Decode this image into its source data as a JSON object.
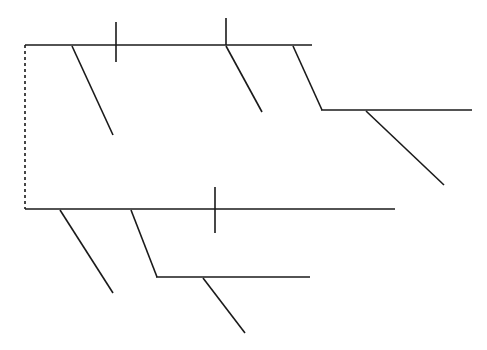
{
  "document": {
    "title": "Branching Line Diagram",
    "background_color": "#ffffff",
    "width": 487,
    "height": 350
  },
  "style": {
    "line_color": "#1a1a1a",
    "line_width": 1.6,
    "tick_width": 1.6,
    "dash_color": "#1a1a1a",
    "dash_width": 1.6,
    "dash_pattern": "3 3"
  },
  "diagram": {
    "type": "branching-line-diagram",
    "elements": {
      "root_connector": {
        "label": "dashed vertical root connector",
        "x1": 25,
        "y1": 45,
        "x2": 25,
        "y2": 209,
        "dashed": true
      },
      "upper_group": {
        "label": "upper branching spine group",
        "spine": {
          "label": "upper main spine",
          "x1": 25,
          "y1": 45,
          "x2": 312,
          "y2": 45
        },
        "ticks": [
          {
            "label": "upper tick one",
            "x": 116,
            "y1": 22,
            "y2": 62
          },
          {
            "label": "upper tick two",
            "x": 226,
            "y1": 18,
            "y2": 45
          }
        ],
        "branches": [
          {
            "label": "upper branch one",
            "x1": 72,
            "y1": 46,
            "x2": 113,
            "y2": 135
          },
          {
            "label": "upper branch two",
            "x1": 226,
            "y1": 46,
            "x2": 262,
            "y2": 112
          }
        ],
        "step_down": {
          "label": "upper step-down diagonal",
          "x1": 293,
          "y1": 46,
          "x2": 322,
          "y2": 110
        },
        "secondary_spine": {
          "label": "upper secondary spine",
          "x1": 321,
          "y1": 110,
          "x2": 472,
          "y2": 110
        },
        "secondary_branches": [
          {
            "label": "upper secondary branch one",
            "x1": 366,
            "y1": 111,
            "x2": 444,
            "y2": 185
          }
        ]
      },
      "lower_group": {
        "label": "lower branching spine group",
        "spine": {
          "label": "lower main spine",
          "x1": 25,
          "y1": 209,
          "x2": 395,
          "y2": 209
        },
        "ticks": [
          {
            "label": "lower tick one",
            "x": 215,
            "y1": 187,
            "y2": 233
          }
        ],
        "branches": [
          {
            "label": "lower branch one",
            "x1": 60,
            "y1": 210,
            "x2": 113,
            "y2": 293
          }
        ],
        "step_down": {
          "label": "lower step-down diagonal",
          "x1": 131,
          "y1": 210,
          "x2": 157,
          "y2": 277
        },
        "secondary_spine": {
          "label": "lower secondary spine",
          "x1": 156,
          "y1": 277,
          "x2": 310,
          "y2": 277
        },
        "secondary_branches": [
          {
            "label": "lower secondary branch one",
            "x1": 203,
            "y1": 278,
            "x2": 245,
            "y2": 333
          }
        ]
      }
    }
  }
}
